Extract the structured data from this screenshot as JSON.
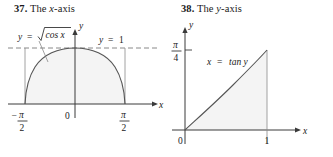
{
  "page": {
    "width": 333,
    "height": 157,
    "background": "#ffffff",
    "ink": "#1a1a1a",
    "curve_color": "#555555",
    "shade_color": "#f2f2f2"
  },
  "exercises": [
    {
      "number": "37.",
      "prompt_prefix": "The ",
      "prompt_axis": "x",
      "prompt_suffix": "-axis",
      "figure": {
        "name": "sqrt-cos-figure",
        "axis_labels": {
          "x": "x",
          "y": "y"
        },
        "curve_label": "y = √cos x",
        "line_label": "y = 1",
        "x_ticks": [
          {
            "value": -1.5707963,
            "label_num": "π",
            "label_den": "2",
            "sign": "−"
          },
          {
            "value": 0,
            "label": "0"
          },
          {
            "value": 1.5707963,
            "label_num": "π",
            "label_den": "2",
            "sign": ""
          }
        ],
        "curve_expression": "y = sqrt(cos x)",
        "domain": [
          -1.5707963,
          1.5707963
        ],
        "range": [
          0,
          1
        ],
        "dashed_line_y": 1
      }
    },
    {
      "number": "38.",
      "prompt_prefix": "The ",
      "prompt_axis": "y",
      "prompt_suffix": "-axis",
      "figure": {
        "name": "tan-y-figure",
        "axis_labels": {
          "x": "x",
          "y": "y"
        },
        "curve_label": "x = tan y",
        "y_ticks": [
          {
            "value": 0.7853982,
            "label_num": "π",
            "label_den": "4"
          }
        ],
        "x_ticks": [
          {
            "value": 0,
            "label": "0"
          },
          {
            "value": 1,
            "label": "1"
          }
        ],
        "curve_expression": "x = tan y",
        "domain": [
          0,
          1
        ],
        "range": [
          0,
          0.7853982
        ]
      }
    }
  ]
}
